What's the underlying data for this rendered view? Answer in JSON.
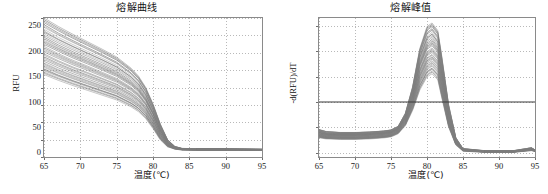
{
  "figure": {
    "background": "#ffffff",
    "curve_color": "#7d7d7d",
    "threshold_color": "#3b3b3b",
    "axis_color": "#8a8a8a",
    "grid_color": "#b9b9b9"
  },
  "chart_data": [
    {
      "type": "line",
      "panel": "left",
      "title": "熔解曲线",
      "xlabel": "温度(℃)",
      "ylabel": "RFU",
      "xlim": [
        65,
        95
      ],
      "ylim": [
        2000,
        3600
      ],
      "xticks": [
        65,
        70,
        75,
        80,
        85,
        90,
        95
      ],
      "yticks": [
        2000,
        2200,
        2400,
        2600,
        2800,
        3000,
        3200,
        3400,
        3600
      ],
      "grid": true,
      "legend": "none",
      "series_count": 40,
      "description": "Overlaid sigmoidal melt curves decaying from ~2950-3600 RFU at 65C to a flat plateau of ~2090 RFU above 84C, with the steep transition centered near 80.5C.",
      "x": [
        65,
        67,
        69,
        71,
        73,
        75,
        77,
        78,
        79,
        80,
        81,
        82,
        83,
        84,
        86,
        90,
        95
      ],
      "series": [
        {
          "name": "band-top",
          "values": [
            3600,
            3500,
            3410,
            3325,
            3240,
            3150,
            3020,
            2930,
            2800,
            2610,
            2380,
            2200,
            2120,
            2095,
            2090,
            2090,
            2088
          ]
        },
        {
          "name": "band-upper-mid",
          "values": [
            3420,
            3330,
            3250,
            3175,
            3100,
            3020,
            2905,
            2825,
            2705,
            2535,
            2330,
            2175,
            2110,
            2092,
            2088,
            2088,
            2086
          ]
        },
        {
          "name": "band-mid",
          "values": [
            3250,
            3170,
            3095,
            3030,
            2960,
            2890,
            2790,
            2720,
            2615,
            2465,
            2285,
            2155,
            2105,
            2090,
            2086,
            2086,
            2084
          ]
        },
        {
          "name": "band-lower-mid",
          "values": [
            3080,
            3005,
            2940,
            2880,
            2820,
            2760,
            2670,
            2610,
            2520,
            2390,
            2240,
            2135,
            2098,
            2086,
            2084,
            2084,
            2082
          ]
        },
        {
          "name": "band-bottom",
          "values": [
            2950,
            2885,
            2825,
            2770,
            2715,
            2660,
            2580,
            2525,
            2445,
            2330,
            2200,
            2120,
            2094,
            2084,
            2082,
            2082,
            2080
          ]
        }
      ]
    },
    {
      "type": "line",
      "panel": "right",
      "title": "熔解峰值",
      "xlabel": "温度(℃)",
      "ylabel": "-d(RFU)/dT",
      "xlim": [
        65,
        95
      ],
      "ylim": [
        -8,
        265
      ],
      "xticks": [
        65,
        70,
        75,
        80,
        85,
        90,
        95
      ],
      "yticks": [
        0,
        50,
        100,
        150,
        200,
        250
      ],
      "grid": true,
      "legend": "none",
      "series_count": 40,
      "threshold_line": {
        "value": 100,
        "color": "#3b3b3b",
        "label": ""
      },
      "description": "Overlaid negative-derivative melt peaks; baseline shoulder near 30-45 from 65-76C, single sharp peak at about 80.7C reaching 150-255, returning to ~2 above 85C with a small uptick at 95C.",
      "x": [
        65,
        66,
        68,
        70,
        72,
        74,
        75,
        76,
        77,
        78,
        79,
        80,
        80.7,
        81.5,
        82,
        83,
        84,
        85,
        88,
        92,
        94.5,
        95
      ],
      "series": [
        {
          "name": "peak-max",
          "values": [
            46,
            42,
            40,
            40,
            41,
            43,
            45,
            52,
            78,
            130,
            205,
            248,
            255,
            240,
            195,
            95,
            30,
            8,
            4,
            4,
            10,
            6
          ]
        },
        {
          "name": "peak-upper",
          "values": [
            42,
            38,
            37,
            37,
            38,
            40,
            42,
            49,
            72,
            118,
            185,
            222,
            230,
            215,
            172,
            82,
            26,
            7,
            3,
            3,
            8,
            5
          ]
        },
        {
          "name": "peak-mid",
          "values": [
            38,
            35,
            34,
            34,
            35,
            37,
            39,
            46,
            66,
            106,
            163,
            196,
            203,
            190,
            150,
            70,
            22,
            6,
            3,
            3,
            7,
            4
          ]
        },
        {
          "name": "peak-lower",
          "values": [
            34,
            31,
            30,
            30,
            31,
            33,
            35,
            42,
            60,
            95,
            143,
            172,
            178,
            166,
            130,
            60,
            19,
            5,
            2,
            2,
            6,
            4
          ]
        },
        {
          "name": "peak-min",
          "values": [
            30,
            28,
            27,
            27,
            28,
            30,
            32,
            38,
            54,
            84,
            124,
            150,
            156,
            144,
            112,
            51,
            16,
            4,
            2,
            2,
            5,
            3
          ]
        }
      ]
    }
  ]
}
